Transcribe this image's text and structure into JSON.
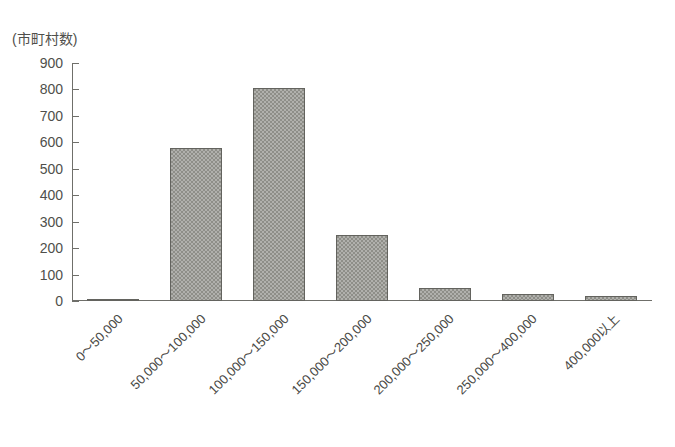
{
  "chart_data": {
    "type": "bar",
    "title": "",
    "subtitle": "",
    "xlabel": "",
    "ylabel": "(市町村数)",
    "ylim": [
      0,
      900
    ],
    "ytick_step": 100,
    "yticks": [
      900,
      800,
      700,
      600,
      500,
      400,
      300,
      200,
      100,
      0
    ],
    "grid": false,
    "legend": null,
    "x_label_rotation_deg": -45,
    "categories": [
      "0〜50,000",
      "50,000〜100,000",
      "100,000〜150,000",
      "150,000〜200,000",
      "200,000〜250,000",
      "250,000〜400,000",
      "400,000以上"
    ],
    "values": [
      8,
      580,
      805,
      248,
      48,
      27,
      20
    ],
    "bar_fill_color": "#8e8e88",
    "bar_border_color": "#63635e",
    "axis_color": "#6f6f6a",
    "text_color": "#4a4a46",
    "background_color": "#ffffff"
  },
  "axis": {
    "y_unit_caption": "(市町村数)"
  }
}
